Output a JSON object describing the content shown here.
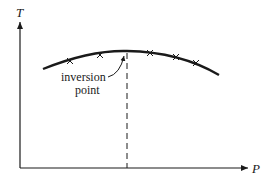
{
  "diagram": {
    "y_axis_label": "T",
    "x_axis_label": "P",
    "annotation_line1": "inversion",
    "annotation_line2": "point",
    "curve": "inversion curve (temperature vs pressure)",
    "markers": "x"
  }
}
